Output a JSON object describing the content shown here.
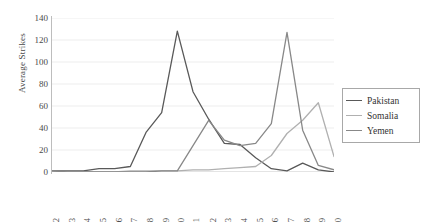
{
  "chart_data": {
    "type": "line",
    "title": "",
    "xlabel": "",
    "ylabel": "Average Strikes",
    "ylim": [
      0,
      140
    ],
    "ytick_step": 20,
    "yticks": [
      0,
      20,
      40,
      60,
      80,
      100,
      120,
      140
    ],
    "grid": true,
    "grid_axis": "y",
    "legend_position": "right",
    "categories": [
      "2002",
      "2003",
      "2004",
      "2005",
      "2006",
      "2007",
      "2008",
      "2009",
      "2010",
      "2011",
      "2012",
      "2013",
      "2014",
      "2015",
      "2016",
      "2017",
      "2018",
      "2019",
      "2020"
    ],
    "series": [
      {
        "name": "Pakistan",
        "color": "#595959",
        "values": [
          1,
          1,
          1,
          3,
          3,
          5,
          36,
          54,
          128,
          73,
          48,
          26,
          25,
          13,
          3,
          1,
          8,
          2,
          0
        ]
      },
      {
        "name": "Somalia",
        "color": "#b0b0b0",
        "values": [
          0,
          0,
          0,
          0,
          0,
          1,
          1,
          1,
          1,
          2,
          2,
          3,
          4,
          5,
          15,
          35,
          47,
          63,
          14
        ]
      },
      {
        "name": "Yemen",
        "color": "#888888",
        "values": [
          1,
          0,
          0,
          0,
          0,
          0,
          0,
          1,
          1,
          24,
          47,
          29,
          24,
          26,
          44,
          127,
          38,
          6,
          2
        ]
      }
    ]
  },
  "legend": {
    "items": [
      {
        "label": "Pakistan"
      },
      {
        "label": "Somalia"
      },
      {
        "label": "Yemen"
      }
    ]
  },
  "axes": {
    "y_title": "Average Strikes"
  }
}
